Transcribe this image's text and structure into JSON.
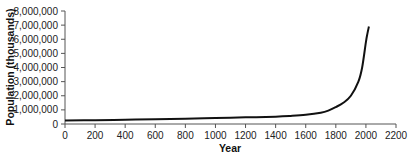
{
  "chart_data": {
    "type": "line",
    "title": "",
    "xlabel": "Year",
    "ylabel": "Population (thousands)",
    "xlim": [
      0,
      2200
    ],
    "ylim": [
      0,
      8000000
    ],
    "x_ticks": [
      0,
      200,
      400,
      600,
      800,
      1000,
      1200,
      1400,
      1600,
      1800,
      2000,
      2200
    ],
    "y_ticks": [
      0,
      1000000,
      2000000,
      3000000,
      4000000,
      5000000,
      6000000,
      7000000,
      8000000
    ],
    "y_tick_labels": [
      "0",
      "1,000,000",
      "2,000,000",
      "3,000,000",
      "4,000,000",
      "5,000,000",
      "6,000,000",
      "7,000,000",
      "8,000,000"
    ],
    "grid": false,
    "legend": null,
    "series": [
      {
        "name": "World population",
        "color": "#111111",
        "x": [
          0,
          200,
          400,
          600,
          800,
          1000,
          1200,
          1400,
          1500,
          1600,
          1700,
          1750,
          1800,
          1850,
          1900,
          1950,
          1975,
          2000,
          2010,
          2020
        ],
        "values": [
          250000,
          270000,
          300000,
          330000,
          370000,
          420000,
          470000,
          520000,
          570000,
          650000,
          800000,
          950000,
          1200000,
          1500000,
          2000000,
          3000000,
          4000000,
          5800000,
          6400000,
          6900000
        ]
      }
    ]
  }
}
